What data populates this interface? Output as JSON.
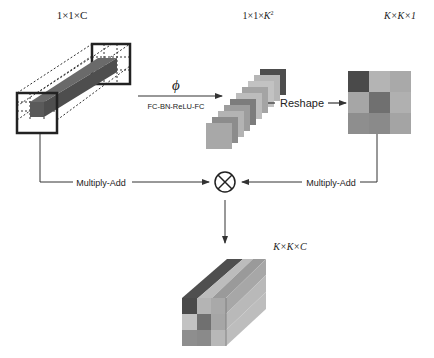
{
  "labels": {
    "input_shape": "1×1×C",
    "kernel_vec_shape_prefix": "1×1×",
    "kernel_vec_shape_var": "K",
    "kernel_vec_shape_exp": "2",
    "kernel_map_shape": "K×K×1",
    "output_shape": "K×K×C",
    "phi": "ϕ",
    "transform": "FC-BN-ReLU-FC",
    "reshape": "Reshape",
    "multiply_add_left": "Multiply-Add",
    "multiply_add_right": "Multiply-Add",
    "operator": "⊗"
  },
  "colors": {
    "line": "#333333",
    "dark": "#4a4a4a",
    "mid": "#7a7a7a",
    "light": "#a8a8a8",
    "pale": "#c6c6c6"
  },
  "kernel_grid": [
    [
      "#4a4a4a",
      "#b4b4b4",
      "#a9a9a9"
    ],
    [
      "#a6a6a6",
      "#707070",
      "#b0b0b0"
    ],
    [
      "#8e8e8e",
      "#8a8a8a",
      "#a4a4a4"
    ]
  ],
  "stack_layers": [
    "#a8a8a8",
    "#8c8c8c",
    "#b3b3b3",
    "#9d9d9d",
    "#7c7c7c",
    "#bcbcbc",
    "#a4a4a4",
    "#c2c2c2",
    "#b6b6b6",
    "#4d4d4d"
  ]
}
